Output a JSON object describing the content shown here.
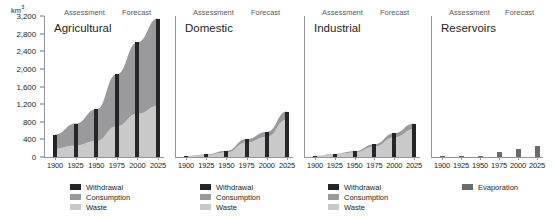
{
  "chart_data": {
    "type": "bar",
    "title": "",
    "ylabel": "km3",
    "ylabel_display": "km",
    "ylabel_sup": "3",
    "xlabel": "",
    "categories": [
      "1900",
      "1925",
      "1950",
      "1975",
      "2000",
      "2025"
    ],
    "ylim": [
      0,
      3200
    ],
    "yticks": [
      0,
      400,
      800,
      1200,
      1600,
      2000,
      2400,
      2800,
      3200
    ],
    "ytick_labels": [
      "0",
      "400",
      "800",
      "1,200",
      "1,600",
      "2,000",
      "2,400",
      "2,800",
      "3,200"
    ],
    "grid": false,
    "legend_position": "below-panel",
    "period_labels": [
      "Assessment",
      "Forecast"
    ],
    "panels": [
      {
        "title": "Agricultural",
        "series": [
          {
            "name": "Withdrawal",
            "values": [
              510,
              760,
              1080,
              1880,
              2600,
              3140
            ]
          },
          {
            "name": "Consumption",
            "values": [
              320,
              500,
              720,
              1180,
              1620,
              1980
            ]
          },
          {
            "name": "Waste",
            "values": [
              190,
              260,
              360,
              700,
              980,
              1160
            ]
          }
        ],
        "legend": [
          "Withdrawal",
          "Consumption",
          "Waste"
        ]
      },
      {
        "title": "Domestic",
        "series": [
          {
            "name": "Withdrawal",
            "values": [
              25,
              60,
              140,
              410,
              570,
              1030
            ]
          },
          {
            "name": "Consumption",
            "values": [
              10,
              20,
              40,
              80,
              110,
              180
            ]
          },
          {
            "name": "Waste",
            "values": [
              15,
              40,
              100,
              330,
              460,
              850
            ]
          }
        ],
        "legend": [
          "Withdrawal",
          "Consumption",
          "Waste"
        ]
      },
      {
        "title": "Industrial",
        "series": [
          {
            "name": "Withdrawal",
            "values": [
              30,
              70,
              130,
              290,
              540,
              760
            ]
          },
          {
            "name": "Consumption",
            "values": [
              5,
              12,
              25,
              55,
              90,
              130
            ]
          },
          {
            "name": "Waste",
            "values": [
              25,
              58,
              105,
              235,
              450,
              630
            ]
          }
        ],
        "legend": [
          "Withdrawal",
          "Consumption",
          "Waste"
        ]
      },
      {
        "title": "Reservoirs",
        "series": [
          {
            "name": "Evaporation",
            "values": [
              10,
              20,
              25,
              110,
              190,
              260
            ]
          }
        ],
        "legend": [
          "Evaporation"
        ]
      }
    ]
  },
  "colors": {
    "withdrawal": "#262628",
    "consumption": "#9a9a9c",
    "waste": "#c9c9ca",
    "evaporation": "#6a6a6c",
    "axis": "#939598",
    "text": "#231f20",
    "header_text": "#58595b"
  },
  "axis": {
    "unit_base": "km",
    "unit_exp": "3"
  },
  "headers": {
    "assessment": "Assessment",
    "forecast": "Forecast"
  },
  "legend_labels": {
    "withdrawal": "Withdrawal",
    "consumption": "Consumption",
    "waste": "Waste",
    "evaporation": "Evaporation"
  }
}
